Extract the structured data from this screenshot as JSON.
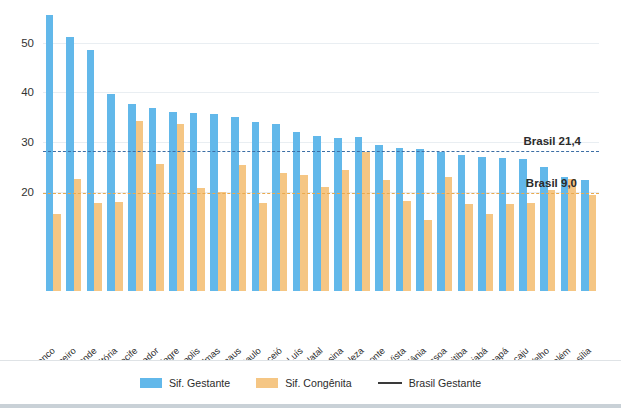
{
  "chart_data": {
    "type": "bar",
    "title": "",
    "subtitle": "",
    "xlabel": "",
    "ylabel": "",
    "ylim": [
      0,
      57
    ],
    "yticks": [
      20,
      30,
      40,
      50
    ],
    "grid": true,
    "legend_position": "bottom",
    "categories": [
      "Rio Branco",
      "Rio de Janeiro",
      "Campo Grande",
      "Vitória",
      "Recife",
      "Salvador",
      "Porto Alegre",
      "Florianópolis",
      "Palmas",
      "Manaus",
      "São Paulo",
      "Maceió",
      "São Luís",
      "Natal",
      "Teresina",
      "Fortaleza",
      "Belo Horizonte",
      "Boa Vista",
      "Goiânia",
      "João Pessoa",
      "Curitiba",
      "Cuiabá",
      "Macapá",
      "Aracaju",
      "Porto Velho",
      "Belém",
      "Brasília"
    ],
    "series": [
      {
        "name": "Sif. Gestante",
        "color": "#62b8ea",
        "values": [
          55.5,
          51.2,
          48.5,
          39.6,
          37.6,
          36.8,
          36.1,
          35.9,
          35.7,
          35.1,
          34.0,
          33.6,
          32.1,
          31.2,
          30.9,
          31.0,
          29.4,
          28.9,
          28.7,
          28.0,
          27.3,
          26.9,
          26.8,
          26.6,
          24.9,
          23.0,
          22.4
        ]
      },
      {
        "name": "Sif. Congênita",
        "color": "#f5c684",
        "values": [
          15.5,
          22.5,
          17.7,
          18.0,
          34.2,
          25.6,
          33.6,
          20.7,
          19.9,
          25.3,
          17.8,
          23.7,
          23.3,
          21.0,
          24.4,
          28.0,
          22.4,
          18.1,
          14.3,
          23.0,
          17.6,
          15.6,
          17.5,
          17.8,
          20.4,
          22.6,
          19.3
        ]
      }
    ],
    "reference_lines": [
      {
        "name": "Brasil Gestante",
        "label": "Brasil 21,4",
        "value": 21.4,
        "display_y": 28.1,
        "color": "#3c6ea5",
        "style": "dashed"
      },
      {
        "name": "Brasil Congênita",
        "label": "Brasil 9,0",
        "value": 9.0,
        "display_y": 19.7,
        "color": "#eaa94e",
        "style": "dashed"
      }
    ],
    "legend": [
      {
        "label": "Sif. Gestante",
        "type": "swatch",
        "color": "#62b8ea"
      },
      {
        "label": "Sif. Congênita",
        "type": "swatch",
        "color": "#f5c684"
      },
      {
        "label": "Brasil Gestante",
        "type": "line",
        "color": "#3a3a3a"
      }
    ]
  }
}
